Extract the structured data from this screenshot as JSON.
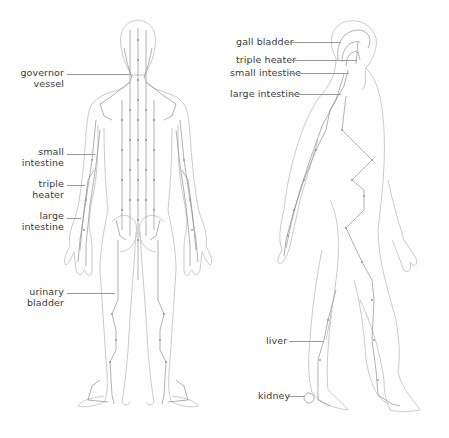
{
  "diagram": {
    "colors": {
      "outline": "#bdbdbd",
      "meridian": "#8a8a8a",
      "point": "#8a8a8a",
      "label": "#3a3a3a",
      "leader": "#9a9a9a"
    },
    "back_view": {
      "labels": [
        {
          "id": "governor-vessel",
          "lines": [
            "governor",
            "vessel"
          ]
        },
        {
          "id": "small-intestine",
          "lines": [
            "small",
            "intestine"
          ]
        },
        {
          "id": "triple-heater",
          "lines": [
            "triple",
            "heater"
          ]
        },
        {
          "id": "large-intestine",
          "lines": [
            "large",
            "intestine"
          ]
        },
        {
          "id": "urinary-bladder",
          "lines": [
            "urinary",
            "bladder"
          ]
        }
      ]
    },
    "side_view": {
      "labels": [
        {
          "id": "gall-bladder",
          "text": "gall bladder"
        },
        {
          "id": "triple-heater",
          "text": "triple heater"
        },
        {
          "id": "small-intestine",
          "text": "small intestine"
        },
        {
          "id": "large-intestine",
          "text": "large intestine"
        },
        {
          "id": "liver",
          "text": "liver"
        },
        {
          "id": "kidney",
          "text": "kidney"
        }
      ]
    }
  }
}
